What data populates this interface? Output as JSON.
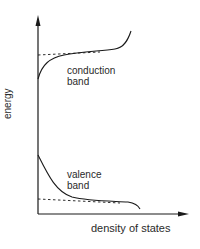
{
  "diagram": {
    "y_axis_label": "energy",
    "x_axis_label": "density of states",
    "conduction": {
      "line1": "conduction",
      "line2": "band"
    },
    "valence": {
      "line1": "valence",
      "line2": "band"
    },
    "colors": {
      "stroke": "#1a1a1a",
      "text": "#2a2a2a",
      "background": "#ffffff"
    }
  }
}
